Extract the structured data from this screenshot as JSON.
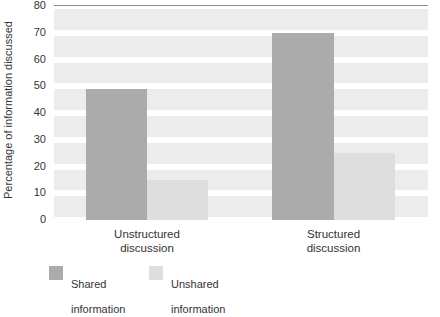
{
  "chart_data": {
    "type": "bar",
    "title": "",
    "xlabel": "",
    "ylabel": "Percentage of information discussed",
    "categories": [
      "Unstructured\ndiscussion",
      "Structured\ndiscussion"
    ],
    "series": [
      {
        "name": "Shared\ninformation",
        "values": [
          49,
          70
        ],
        "color": "#ababab"
      },
      {
        "name": "Unshared\ninformation",
        "values": [
          15,
          25
        ],
        "color": "#dedede"
      }
    ],
    "ylim": [
      0,
      80
    ],
    "yticks": [
      80,
      70,
      60,
      50,
      40,
      30,
      20,
      10,
      0
    ],
    "ytick_labels": [
      "80",
      "70",
      "60",
      "50",
      "40",
      "30",
      "20",
      "10",
      "0"
    ],
    "grid": "horizontal-bands",
    "legend_position": "bottom-left",
    "background": "#ffffff",
    "band_color": "#ececec"
  },
  "axis": {
    "y_title": "Percentage of information discussed"
  },
  "x_labels": [
    {
      "line1": "Unstructured",
      "line2": "discussion"
    },
    {
      "line1": "Structured",
      "line2": "discussion"
    }
  ],
  "legend": {
    "items": [
      {
        "line1": "Shared",
        "line2": "information",
        "swatch": "#ababab"
      },
      {
        "line1": "Unshared",
        "line2": "information",
        "swatch": "#dedede"
      }
    ]
  }
}
